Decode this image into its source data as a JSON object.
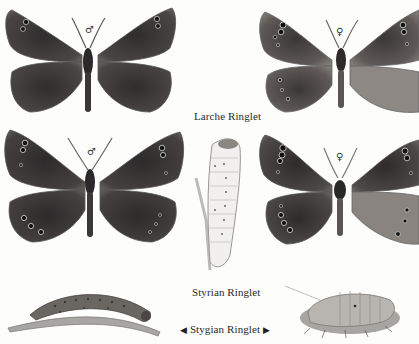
{
  "plate": {
    "title_row1": "Larche Ringlet",
    "title_row2": "Styrian Ringlet",
    "title_row3": "Stygian Ringlet",
    "arrow_left": "◀",
    "arrow_right": "▶"
  },
  "specimens": [
    {
      "id": "larche-male",
      "species": "Larche Ringlet",
      "sex_symbol": "♂",
      "position": "top-left"
    },
    {
      "id": "larche-female",
      "species": "Larche Ringlet",
      "sex_symbol": "♀",
      "position": "top-right"
    },
    {
      "id": "styrian-male",
      "species": "Styrian Ringlet",
      "sex_symbol": "♂",
      "position": "middle-left"
    },
    {
      "id": "styrian-female",
      "species": "Styrian Ringlet",
      "sex_symbol": "♀",
      "position": "middle-right"
    },
    {
      "id": "styrian-larva",
      "species": "Styrian Ringlet",
      "stage": "larva",
      "position": "center"
    },
    {
      "id": "stygian-larva",
      "species": "Stygian Ringlet",
      "stage": "larva",
      "position": "bottom-left"
    },
    {
      "id": "stygian-pupa",
      "species": "Stygian Ringlet",
      "stage": "pupa",
      "position": "bottom-right"
    }
  ],
  "colors": {
    "background": "#fdfdfc",
    "wing_dark": "#3a3838",
    "wing_mid": "#5a5654",
    "wing_light": "#8a8480",
    "text": "#2a2a2a"
  }
}
